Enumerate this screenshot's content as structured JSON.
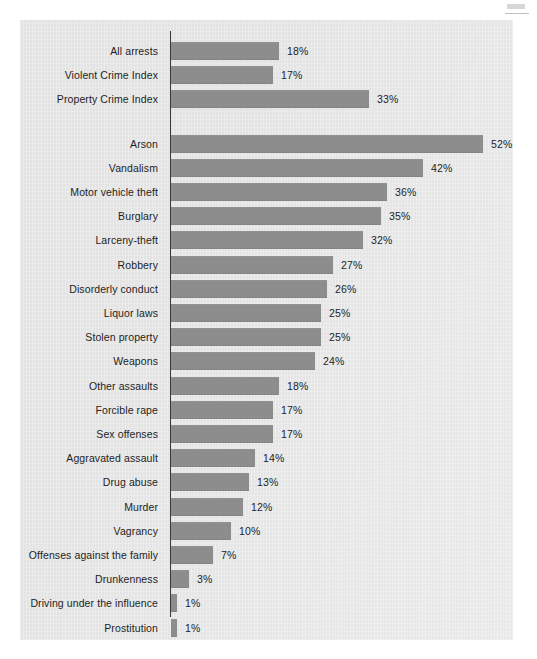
{
  "chart_data": {
    "type": "bar",
    "orientation": "horizontal",
    "title": "",
    "subtitle": "",
    "xlabel": "",
    "ylabel": "",
    "xlim": [
      0,
      55
    ],
    "grid": false,
    "legend": null,
    "value_suffix": "%",
    "bar_color": "#8d8d8d",
    "panel_color": "#e3e3e3",
    "axis_color": "#3a3a3a",
    "groups": [
      {
        "name": "summary-indices",
        "categories": [
          "All arrests",
          "Violent Crime Index",
          "Property Crime Index"
        ],
        "values": [
          18,
          17,
          33
        ],
        "labels": [
          "18%",
          "17%",
          "33%"
        ]
      },
      {
        "name": "offense-detail",
        "categories": [
          "Arson",
          "Vandalism",
          "Motor vehicle theft",
          "Burglary",
          "Larceny-theft",
          "Robbery",
          "Disorderly conduct",
          "Liquor laws",
          "Stolen property",
          "Weapons",
          "Other assaults",
          "Forcible rape",
          "Sex offenses",
          "Aggravated assault",
          "Drug abuse",
          "Murder",
          "Vagrancy",
          "Offenses against the family",
          "Drunkenness",
          "Driving under the influence",
          "Prostitution"
        ],
        "values": [
          52,
          42,
          36,
          35,
          32,
          27,
          26,
          25,
          25,
          24,
          18,
          17,
          17,
          14,
          13,
          12,
          10,
          7,
          3,
          1,
          1
        ],
        "labels": [
          "52%",
          "42%",
          "36%",
          "35%",
          "32%",
          "27%",
          "26%",
          "25%",
          "25%",
          "24%",
          "18%",
          "17%",
          "17%",
          "14%",
          "13%",
          "12%",
          "10%",
          "7%",
          "3%",
          "1%",
          "1%"
        ]
      }
    ],
    "categories": [
      "All arrests",
      "Violent Crime Index",
      "Property Crime Index",
      "Arson",
      "Vandalism",
      "Motor vehicle theft",
      "Burglary",
      "Larceny-theft",
      "Robbery",
      "Disorderly conduct",
      "Liquor laws",
      "Stolen property",
      "Weapons",
      "Other assaults",
      "Forcible rape",
      "Sex offenses",
      "Aggravated assault",
      "Drug abuse",
      "Murder",
      "Vagrancy",
      "Offenses against the family",
      "Drunkenness",
      "Driving under the influence",
      "Prostitution"
    ],
    "values": [
      18,
      17,
      33,
      52,
      42,
      36,
      35,
      32,
      27,
      26,
      25,
      25,
      24,
      18,
      17,
      17,
      14,
      13,
      12,
      10,
      7,
      3,
      1,
      1
    ]
  }
}
